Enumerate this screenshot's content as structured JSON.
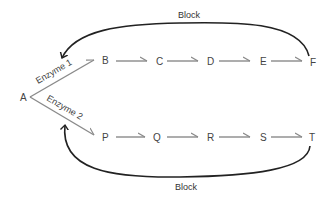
{
  "diagram": {
    "nodes": {
      "A": "A",
      "top": [
        "B",
        "C",
        "D",
        "E",
        "F"
      ],
      "bottom": [
        "P",
        "Q",
        "R",
        "S",
        "T"
      ]
    },
    "branch_labels": {
      "top": "Enzyme 1",
      "bottom": "Enzyme 2"
    },
    "feedback_labels": {
      "top": "Block",
      "bottom": "Block"
    },
    "colors": {
      "pathway_arrow": "#8a8a8a",
      "feedback_arrow": "#222222",
      "text": "#444444"
    }
  }
}
